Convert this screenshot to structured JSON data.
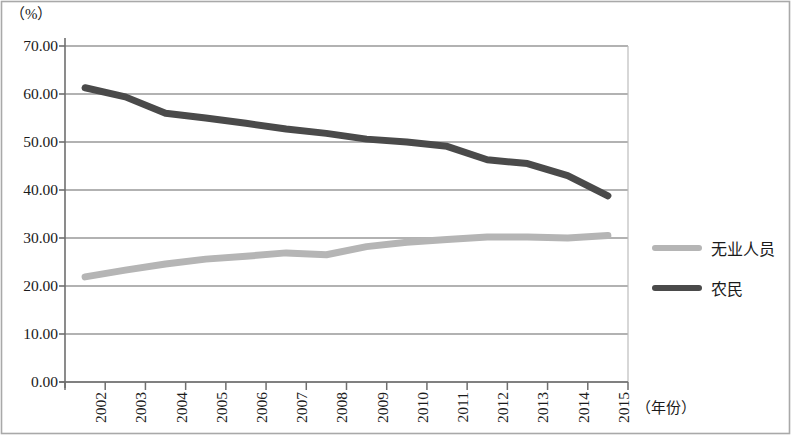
{
  "chart_data": {
    "type": "line",
    "title": "",
    "subtitle": "",
    "xlabel": "（年份）",
    "ylabel": "（%）",
    "x": [
      2002,
      2003,
      2004,
      2005,
      2006,
      2007,
      2008,
      2009,
      2010,
      2011,
      2012,
      2013,
      2014,
      2015
    ],
    "categories": [
      "2002",
      "2003",
      "2004",
      "2005",
      "2006",
      "2007",
      "2008",
      "2009",
      "2010",
      "2011",
      "2012",
      "2013",
      "2014",
      "2015"
    ],
    "series": [
      {
        "name": "无业人员",
        "color": "#b5b5b5",
        "values": [
          21.9,
          23.3,
          24.6,
          25.6,
          26.2,
          26.9,
          26.5,
          28.2,
          29.1,
          29.7,
          30.2,
          30.2,
          30.0,
          30.5
        ]
      },
      {
        "name": "农民",
        "color": "#4a4a4a",
        "values": [
          61.3,
          59.4,
          56.0,
          55.0,
          53.9,
          52.7,
          51.8,
          50.6,
          50.0,
          49.1,
          46.3,
          45.5,
          43.0,
          38.8
        ]
      }
    ],
    "ylim": [
      0,
      70
    ],
    "yticks": [
      70.0,
      60.0,
      50.0,
      40.0,
      30.0,
      20.0,
      10.0,
      0.0
    ],
    "ytick_labels": [
      "70.00",
      "60.00",
      "50.00",
      "40.00",
      "30.00",
      "20.00",
      "10.00",
      "0.00"
    ],
    "grid": true,
    "grid_color": "#999999",
    "legend_position": "right",
    "legend": [
      "无业人员",
      "农民"
    ],
    "frame_color": "#8a8a8a",
    "background": "#ffffff"
  }
}
